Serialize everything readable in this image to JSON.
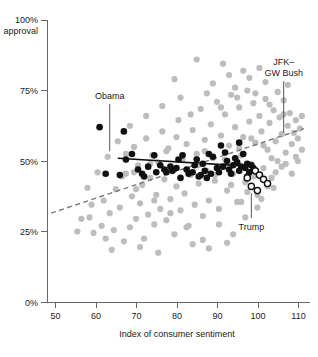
{
  "chart_data": {
    "type": "scatter",
    "title": "",
    "subtitle": "",
    "xlabel": "Index of consumer sentiment",
    "ylabel": "approval",
    "xlim": [
      47,
      112
    ],
    "ylim": [
      0,
      100
    ],
    "xticks": [
      50,
      60,
      70,
      80,
      90,
      100,
      110
    ],
    "xtick_labels": [
      "50",
      "60",
      "70",
      "80",
      "90",
      "100",
      "110"
    ],
    "yticks": [
      0,
      25,
      50,
      75,
      100
    ],
    "ytick_labels": [
      "0%",
      "25%",
      "50%",
      "75%",
      "100%"
    ],
    "ytop_suffix": "approval",
    "grid": false,
    "legend": "none",
    "colors": {
      "gray_points": "#bdbdbd",
      "black_points": "#101010",
      "open_points_stroke": "#101010",
      "solid_trend": "#101010",
      "dashed_trend": "#777777",
      "axis": "#666666"
    },
    "annotations": [
      {
        "id": "obama",
        "label": "Obama",
        "label_lines": [
          "Obama"
        ],
        "x": 62.5,
        "y": 72.0,
        "leader_to_x": 62.5,
        "leader_to_y": 53.5
      },
      {
        "id": "jfk-gw-bush",
        "label": "JFK– GW Bush",
        "label_lines": [
          "JFK–",
          "GW Bush"
        ],
        "x": 105.5,
        "y": 84.0,
        "leader_to_x": 105.5,
        "leader_to_y": 60.0
      },
      {
        "id": "trump",
        "label": "Trump",
        "label_lines": [
          "Trump"
        ],
        "x": 97.5,
        "y": 25.5,
        "leader_to_x": 97.5,
        "leader_to_y": 38.5
      }
    ],
    "trend_lines": [
      {
        "name": "Obama trend",
        "style": "solid",
        "color": "#101010",
        "x1": 64.5,
        "y1": 51.0,
        "x2": 98.5,
        "y2": 48.0
      },
      {
        "name": "JFK–GW Bush trend",
        "style": "dashed",
        "color": "#777777",
        "x1": 48.0,
        "y1": 31.5,
        "x2": 110.5,
        "y2": 61.5
      }
    ],
    "series": [
      {
        "name": "Other presidents (JFK–GW Bush)",
        "marker": "filled-circle",
        "color": "#bdbdbd",
        "points": [
          [
            57.5,
            30.0
          ],
          [
            58.5,
            24.5
          ],
          [
            60.5,
            27.0
          ],
          [
            61.5,
            22.5
          ],
          [
            62.5,
            31.5
          ],
          [
            63.5,
            25.5
          ],
          [
            64.0,
            40.0
          ],
          [
            65.0,
            33.5
          ],
          [
            66.0,
            21.5
          ],
          [
            66.5,
            45.5
          ],
          [
            67.5,
            26.5
          ],
          [
            68.0,
            37.5
          ],
          [
            68.5,
            55.0
          ],
          [
            69.0,
            29.5
          ],
          [
            69.5,
            48.5
          ],
          [
            70.0,
            35.0
          ],
          [
            70.5,
            41.5
          ],
          [
            71.0,
            22.5
          ],
          [
            71.5,
            58.0
          ],
          [
            72.0,
            31.0
          ],
          [
            72.5,
            44.0
          ],
          [
            73.0,
            52.0
          ],
          [
            73.5,
            27.5
          ],
          [
            74.0,
            38.0
          ],
          [
            74.5,
            49.5
          ],
          [
            75.0,
            33.0
          ],
          [
            75.5,
            60.5
          ],
          [
            76.0,
            43.5
          ],
          [
            76.5,
            29.0
          ],
          [
            77.0,
            54.5
          ],
          [
            77.5,
            36.5
          ],
          [
            78.0,
            47.0
          ],
          [
            78.5,
            24.0
          ],
          [
            79.0,
            41.0
          ],
          [
            79.5,
            64.5
          ],
          [
            80.0,
            32.5
          ],
          [
            80.5,
            50.5
          ],
          [
            81.0,
            38.5
          ],
          [
            81.5,
            56.0
          ],
          [
            82.0,
            27.0
          ],
          [
            82.5,
            45.0
          ],
          [
            83.0,
            61.0
          ],
          [
            83.5,
            34.5
          ],
          [
            84.0,
            52.5
          ],
          [
            84.5,
            42.0
          ],
          [
            85.0,
            68.5
          ],
          [
            85.5,
            30.5
          ],
          [
            86.0,
            57.5
          ],
          [
            86.5,
            46.5
          ],
          [
            87.0,
            36.0
          ],
          [
            87.5,
            63.0
          ],
          [
            88.0,
            51.0
          ],
          [
            88.5,
            43.0
          ],
          [
            89.0,
            71.0
          ],
          [
            89.5,
            33.0
          ],
          [
            90.0,
            59.0
          ],
          [
            90.5,
            48.0
          ],
          [
            91.0,
            66.5
          ],
          [
            91.5,
            39.5
          ],
          [
            92.0,
            55.5
          ],
          [
            92.5,
            73.5
          ],
          [
            93.0,
            45.5
          ],
          [
            93.5,
            62.0
          ],
          [
            94.0,
            35.5
          ],
          [
            94.5,
            69.0
          ],
          [
            95.0,
            52.0
          ],
          [
            95.5,
            58.5
          ],
          [
            96.0,
            42.5
          ],
          [
            96.5,
            75.0
          ],
          [
            97.0,
            64.0
          ],
          [
            97.5,
            49.0
          ],
          [
            98.0,
            70.5
          ],
          [
            98.5,
            56.5
          ],
          [
            99.0,
            38.0
          ],
          [
            99.5,
            66.0
          ],
          [
            100.0,
            60.5
          ],
          [
            100.5,
            47.5
          ],
          [
            101.0,
            72.0
          ],
          [
            101.5,
            54.0
          ],
          [
            102.0,
            63.5
          ],
          [
            102.5,
            44.0
          ],
          [
            103.0,
            68.0
          ],
          [
            103.5,
            57.0
          ],
          [
            104.0,
            50.0
          ],
          [
            104.5,
            65.5
          ],
          [
            105.0,
            59.5
          ],
          [
            105.5,
            71.5
          ],
          [
            106.0,
            53.0
          ],
          [
            106.5,
            62.5
          ],
          [
            107.0,
            67.0
          ],
          [
            107.5,
            56.0
          ],
          [
            108.0,
            60.0
          ],
          [
            108.5,
            64.5
          ],
          [
            109.0,
            58.0
          ],
          [
            109.5,
            61.5
          ],
          [
            110.0,
            66.0
          ],
          [
            84.0,
            86.0
          ],
          [
            78.5,
            79.0
          ],
          [
            92.0,
            80.5
          ],
          [
            95.5,
            82.0
          ],
          [
            88.0,
            77.5
          ],
          [
            97.0,
            79.5
          ],
          [
            101.0,
            78.0
          ],
          [
            90.5,
            84.5
          ],
          [
            99.5,
            83.0
          ],
          [
            86.5,
            74.0
          ],
          [
            93.5,
            76.0
          ],
          [
            104.0,
            74.5
          ],
          [
            106.5,
            77.0
          ],
          [
            80.0,
            72.5
          ],
          [
            75.5,
            69.5
          ],
          [
            71.5,
            66.0
          ],
          [
            67.5,
            62.5
          ],
          [
            64.5,
            57.0
          ],
          [
            62.0,
            51.5
          ],
          [
            59.5,
            46.0
          ],
          [
            57.0,
            40.5
          ],
          [
            65.5,
            44.5
          ],
          [
            69.0,
            40.0
          ],
          [
            73.5,
            36.0
          ],
          [
            77.5,
            31.5
          ],
          [
            81.5,
            26.5
          ],
          [
            85.5,
            22.0
          ],
          [
            89.5,
            27.5
          ],
          [
            93.0,
            24.0
          ],
          [
            96.0,
            30.0
          ],
          [
            99.0,
            33.5
          ],
          [
            70.0,
            19.5
          ],
          [
            74.5,
            17.5
          ],
          [
            63.0,
            18.5
          ],
          [
            91.5,
            21.0
          ],
          [
            87.0,
            19.0
          ],
          [
            83.0,
            20.5
          ],
          [
            95.0,
            35.5
          ],
          [
            101.5,
            41.0
          ],
          [
            98.0,
            44.5
          ],
          [
            103.5,
            46.0
          ],
          [
            106.0,
            49.0
          ],
          [
            108.5,
            51.5
          ],
          [
            110.0,
            54.0
          ],
          [
            79.0,
            58.5
          ],
          [
            82.5,
            66.5
          ],
          [
            86.0,
            53.5
          ],
          [
            91.0,
            50.5
          ],
          [
            94.5,
            54.5
          ],
          [
            97.5,
            58.0
          ],
          [
            100.5,
            55.5
          ],
          [
            102.5,
            51.0
          ],
          [
            105.0,
            48.0
          ],
          [
            107.5,
            45.5
          ],
          [
            66.5,
            52.5
          ],
          [
            72.5,
            49.0
          ],
          [
            76.5,
            53.5
          ],
          [
            84.5,
            48.5
          ],
          [
            88.5,
            45.0
          ],
          [
            92.5,
            41.5
          ],
          [
            96.5,
            39.0
          ],
          [
            100.0,
            36.5
          ],
          [
            103.0,
            40.5
          ],
          [
            109.0,
            50.0
          ],
          [
            68.5,
            46.0
          ],
          [
            61.0,
            36.0
          ],
          [
            58.0,
            34.5
          ],
          [
            55.5,
            29.5
          ],
          [
            54.5,
            25.0
          ],
          [
            90.0,
            69.0
          ],
          [
            94.0,
            72.5
          ],
          [
            98.5,
            74.0
          ],
          [
            102.0,
            70.0
          ],
          [
            105.5,
            66.5
          ]
        ]
      },
      {
        "name": "Obama",
        "marker": "filled-circle",
        "color": "#101010",
        "points": [
          [
            60.0,
            62.0
          ],
          [
            66.0,
            60.5
          ],
          [
            66.5,
            50.5
          ],
          [
            61.5,
            45.5
          ],
          [
            65.0,
            45.0
          ],
          [
            71.0,
            44.5
          ],
          [
            73.5,
            52.0
          ],
          [
            75.0,
            48.5
          ],
          [
            76.0,
            47.0
          ],
          [
            76.5,
            46.0
          ],
          [
            77.5,
            48.0
          ],
          [
            78.0,
            46.5
          ],
          [
            79.0,
            47.5
          ],
          [
            79.5,
            50.5
          ],
          [
            80.5,
            52.0
          ],
          [
            81.5,
            47.0
          ],
          [
            82.0,
            45.5
          ],
          [
            83.0,
            46.0
          ],
          [
            83.5,
            48.5
          ],
          [
            84.5,
            44.5
          ],
          [
            85.0,
            45.0
          ],
          [
            86.0,
            46.5
          ],
          [
            86.5,
            44.0
          ],
          [
            87.5,
            45.5
          ],
          [
            88.0,
            51.5
          ],
          [
            89.0,
            47.5
          ],
          [
            89.5,
            46.0
          ],
          [
            90.5,
            48.0
          ],
          [
            91.0,
            53.0
          ],
          [
            91.5,
            50.0
          ],
          [
            92.0,
            47.0
          ],
          [
            92.5,
            45.5
          ],
          [
            93.0,
            48.5
          ],
          [
            93.5,
            51.0
          ],
          [
            94.0,
            49.5
          ],
          [
            94.5,
            46.5
          ],
          [
            95.0,
            48.0
          ],
          [
            95.5,
            52.5
          ],
          [
            96.0,
            47.5
          ],
          [
            96.5,
            49.0
          ],
          [
            97.0,
            46.0
          ],
          [
            97.5,
            48.5
          ],
          [
            94.5,
            56.5
          ],
          [
            90.0,
            55.5
          ],
          [
            87.0,
            52.5
          ],
          [
            80.0,
            44.0
          ],
          [
            74.0,
            46.0
          ],
          [
            72.0,
            48.0
          ],
          [
            69.5,
            47.0
          ],
          [
            68.0,
            52.5
          ],
          [
            70.5,
            45.5
          ],
          [
            84.0,
            50.5
          ],
          [
            85.5,
            49.0
          ],
          [
            98.0,
            47.5
          ],
          [
            96.5,
            44.5
          ]
        ]
      },
      {
        "name": "Trump",
        "marker": "open-circle",
        "color": "#ffffff",
        "points": [
          [
            98.5,
            46.5
          ],
          [
            99.5,
            45.0
          ],
          [
            100.5,
            43.5
          ],
          [
            101.5,
            42.0
          ],
          [
            97.5,
            41.0
          ],
          [
            99.0,
            39.5
          ],
          [
            96.5,
            44.0
          ]
        ]
      }
    ]
  }
}
